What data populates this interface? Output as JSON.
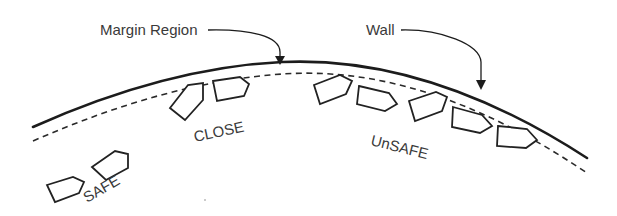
{
  "diagram": {
    "callouts": {
      "margin_region": "Margin Region",
      "wall": "Wall"
    },
    "zones": {
      "safe": "SAFE",
      "close": "CLOSE",
      "unsafe": "UnSAFE"
    },
    "legend": {
      "wall_style": "solid",
      "margin_style": "dashed"
    },
    "vehicle_counts": {
      "safe": 2,
      "close": 2,
      "unsafe": 5
    },
    "colors": {
      "line": "#1c1c1c",
      "text": "#3a3a3a",
      "background": "#ffffff"
    }
  }
}
